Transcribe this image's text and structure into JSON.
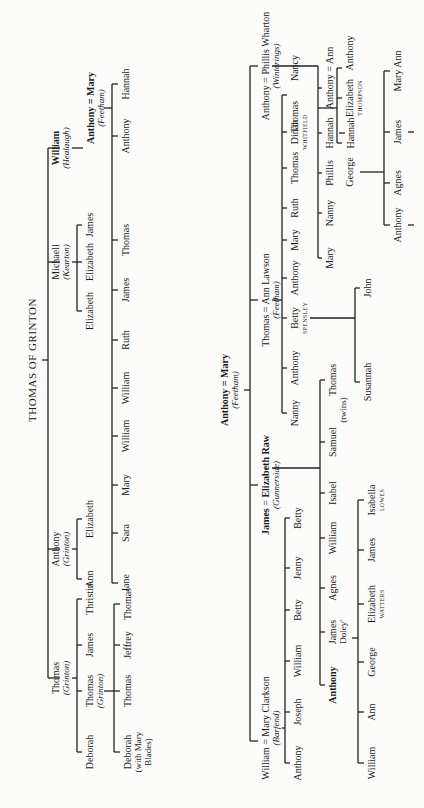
{
  "tree1": {
    "title": "THOMAS OF GRINTON",
    "gen2": [
      {
        "name": "Thomas",
        "place": "(Grinton)"
      },
      {
        "name": "Anthony",
        "place": "(Grinton)"
      },
      {
        "name": "Michaell",
        "place": "(Kearton)"
      },
      {
        "name": "William",
        "place": "(Healaugh)"
      }
    ],
    "thomas_children": [
      "Deborah",
      "Thomas",
      "James",
      "Thristin"
    ],
    "thomas_grinton_place": "(Grinton)",
    "thomas_grandchildren": [
      "Deborah",
      "Thomas",
      "Jeffrey",
      "Thomas"
    ],
    "deborah_note": "(with Mary Blades)",
    "anthony_children": [
      "Ann",
      "Elizabeth"
    ],
    "michaell_children": [
      "Elizabeth",
      "Elizabeth",
      "James"
    ],
    "william_child": {
      "name": "Anthony",
      "spouse": "Mary",
      "place": "(Feetham)"
    },
    "william_grandchildren": [
      "Jane",
      "Sara",
      "Mary",
      "William",
      "William",
      "Ruth",
      "James",
      "Thomas",
      "Anthony",
      "Hannah"
    ]
  },
  "tree2": {
    "root": {
      "name": "Anthony",
      "spouse": "Mary",
      "place": "(Feetham)"
    },
    "children": [
      {
        "name": "William",
        "spouse": "Mary Clarkson",
        "place": "(Barfend)"
      },
      {
        "name": "James",
        "spouse": "Elizabeth Raw",
        "place": "(Gunnerside)"
      },
      {
        "name": "Thomas",
        "spouse": "Ann Lawson",
        "place": "(Feetham)"
      },
      {
        "name": "Anthony",
        "spouse": "Phillis Wharton",
        "place": "(Winterings)"
      }
    ],
    "william_children": [
      "Anthony",
      "Joseph",
      "William",
      "Betty",
      "Jenny",
      "Betty"
    ],
    "james_children": [
      "Anthony",
      "James",
      "Agnes",
      "William",
      "Isabel",
      "Samuel",
      "Thomas"
    ],
    "james_doley": "Doley'",
    "twins_note": "(twins)",
    "james_doley_children": [
      {
        "name": "William"
      },
      {
        "name": "Ann"
      },
      {
        "name": "George"
      },
      {
        "name": "Elizabeth",
        "surname": "WATTERS"
      },
      {
        "name": "James"
      },
      {
        "name": "Isabella",
        "surname": "LOWES"
      }
    ],
    "thomas_children": [
      "Nanny",
      "Anthony",
      "Betty",
      "Anthony",
      "Mary",
      "Ruth",
      "Thomas",
      "Dinah",
      "Thomas",
      "Nancy"
    ],
    "betty_surname": "SPENSLEY",
    "dinah_surname": "WHITFIELD",
    "betty_children": [
      "Susannah",
      "John"
    ],
    "anthony_children": [
      "Mary",
      "Nanny",
      "Phillis",
      "Hannah",
      "Anthony"
    ],
    "hannah_child": "Hannah",
    "anthony_spouse": "Ann",
    "anthony_ann_children": [
      {
        "name": "George"
      },
      {
        "name": "Elizabeth",
        "surname": "THOMPSON"
      },
      {
        "name": "Anthony"
      }
    ],
    "george_children": [
      "Anthony",
      "Agnes",
      "James",
      "Mary Ann"
    ]
  }
}
